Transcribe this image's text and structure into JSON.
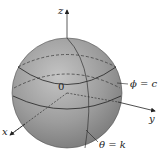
{
  "diagram": {
    "type": "sphere-spherical-coordinates",
    "axes": {
      "x": "x",
      "y": "y",
      "z": "z"
    },
    "origin_label": "0",
    "phi_label": "ϕ = c",
    "theta_label": "θ = k",
    "colors": {
      "sphere": "#9a9a9a",
      "highlight": "#c8c8c8",
      "lines": "#2a2a2a"
    }
  }
}
